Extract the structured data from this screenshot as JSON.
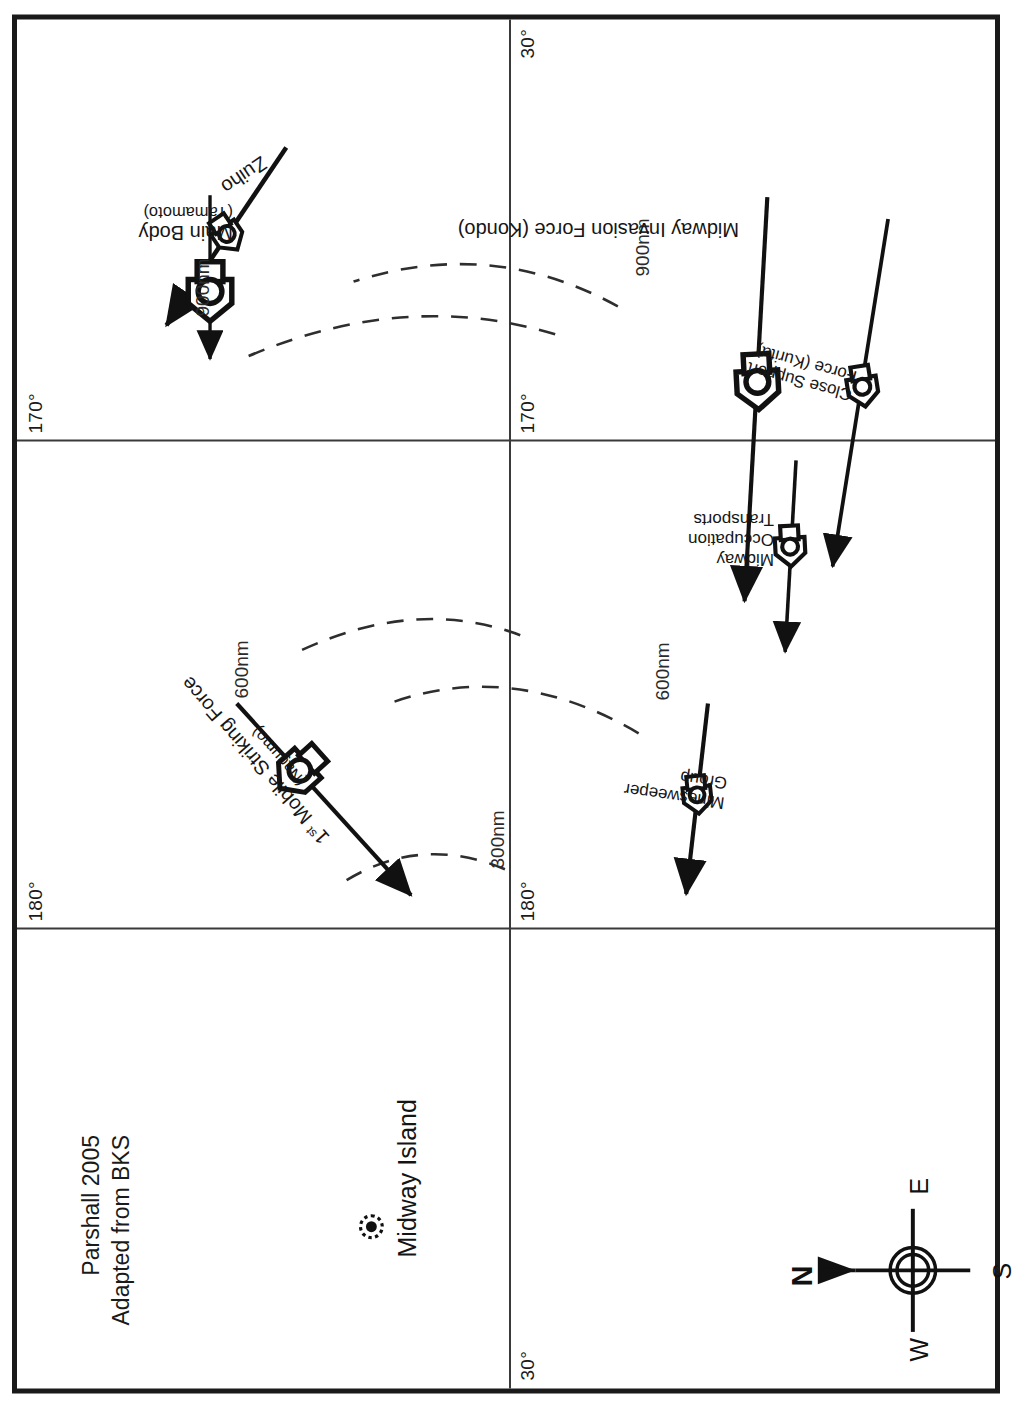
{
  "figure": {
    "credit_line_1": "Parshall 2005",
    "credit_line_2": "Adapted from BKS"
  },
  "compass": {
    "north": "N",
    "east": "E",
    "south": "S",
    "west": "W"
  },
  "graticule": {
    "meridians": [
      {
        "label": "170°",
        "position": "left"
      },
      {
        "label": "180°",
        "position": "center"
      },
      {
        "label": "30°",
        "position": "right"
      }
    ],
    "top_left_label": "30°",
    "top_mid_label": "180°",
    "top_right_label": "170°",
    "bottom_left_label": "30°",
    "bottom_mid_label": "180°",
    "bottom_right_label": "170°"
  },
  "landmarks": [
    {
      "name": "Midway Island",
      "symbol": "atoll-dot"
    }
  ],
  "range_arcs": [
    {
      "label": "300nm",
      "radius_nm": 300
    },
    {
      "label": "600nm",
      "radius_nm": 600
    },
    {
      "label": "900nm",
      "radius_nm": 900
    },
    {
      "label": "600nm",
      "radius_nm": 600
    },
    {
      "label": "900nm",
      "radius_nm": 900
    }
  ],
  "forces": [
    {
      "id": "first-mobile-striking-force",
      "name": "1",
      "name_ordinal": "st",
      "name_rest": " Mobile Striking Force",
      "commander": "(Nagumo)",
      "symbol": "carrier-task-force"
    },
    {
      "id": "main-body",
      "name": "Main Body",
      "commander": "(Yamamoto)",
      "symbol": "battleship-force"
    },
    {
      "id": "zuiho",
      "name": "Zuiho",
      "commander": "",
      "symbol": "light-carrier"
    },
    {
      "id": "midway-invasion-force",
      "name": "Midway Invasion Force (Kondo)",
      "commander": "",
      "symbol": "invasion-force"
    },
    {
      "id": "close-support-force",
      "name_line_1": "Close Support",
      "name_line_2": "Force (Kurita)",
      "commander": "",
      "symbol": "cruiser-force"
    },
    {
      "id": "midway-occupation-transports",
      "name_line_1": "Midway",
      "name_line_2": "Occupation",
      "name_line_3": "Transports",
      "commander": "",
      "symbol": "transport-force"
    },
    {
      "id": "minesweeper-group",
      "name_line_1": "Minesweeper",
      "name_line_2": "Group",
      "commander": "",
      "symbol": "minesweeper-force"
    }
  ]
}
